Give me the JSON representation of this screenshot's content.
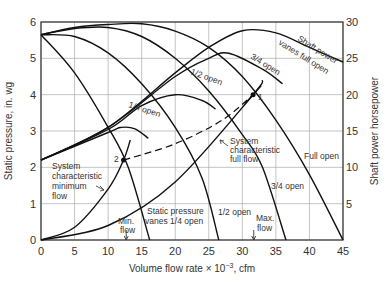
{
  "chart_data": {
    "type": "line",
    "title": "",
    "xlabel": "Volume flow rate × 10⁻³, cfm",
    "ylabel": "Static pressure, in. wg",
    "y2label": "Shaft power horsepower",
    "xlim": [
      0,
      45
    ],
    "ylim": [
      0,
      6
    ],
    "y2lim": [
      0,
      30
    ],
    "xticks": [
      0,
      5,
      10,
      15,
      20,
      25,
      30,
      35,
      40,
      45
    ],
    "yticks": [
      0,
      1,
      2,
      3,
      4,
      5,
      6
    ],
    "y2ticks": [
      5,
      10,
      15,
      20,
      25,
      30
    ],
    "grid": true,
    "series": [
      {
        "name": "Static pressure full open",
        "axis": "left",
        "x": [
          0,
          5,
          10,
          15,
          20,
          25,
          30,
          35,
          40,
          45
        ],
        "y": [
          5.65,
          5.85,
          5.93,
          5.95,
          5.75,
          5.3,
          4.5,
          3.3,
          1.8,
          0
        ]
      },
      {
        "name": "Static pressure 3/4 open",
        "axis": "left",
        "x": [
          0,
          5,
          10,
          15,
          20,
          25,
          30,
          33,
          36.5
        ],
        "y": [
          5.65,
          5.82,
          5.85,
          5.6,
          5.0,
          4.1,
          2.9,
          2.0,
          0
        ]
      },
      {
        "name": "Static pressure 1/2 open",
        "axis": "left",
        "x": [
          0,
          5,
          10,
          15,
          20,
          24,
          26.5
        ],
        "y": [
          5.65,
          5.6,
          5.15,
          4.3,
          3.1,
          1.7,
          0
        ]
      },
      {
        "name": "Static pressure vanes 1/4 open",
        "axis": "left",
        "x": [
          0,
          5,
          10,
          13,
          16.2
        ],
        "y": [
          5.65,
          4.6,
          3.1,
          2.0,
          0
        ]
      },
      {
        "name": "Shaft power vanes full open",
        "axis": "right",
        "x": [
          0,
          10,
          20,
          25,
          30,
          35,
          40,
          45
        ],
        "y": [
          11,
          15.5,
          23,
          26.5,
          28.8,
          28.5,
          26.5,
          24.5
        ]
      },
      {
        "name": "Shaft power 3/4 open",
        "axis": "right",
        "x": [
          0,
          10,
          20,
          25,
          28,
          33,
          36
        ],
        "y": [
          11,
          15.5,
          22.5,
          25,
          25.7,
          23.5,
          21.5
        ]
      },
      {
        "name": "Shaft power 1/2 open",
        "axis": "right",
        "x": [
          0,
          10,
          15,
          20,
          24,
          26
        ],
        "y": [
          11,
          15.2,
          18.5,
          20,
          19.2,
          18
        ]
      },
      {
        "name": "Shaft power 1/4 open",
        "axis": "right",
        "x": [
          0,
          10,
          12,
          14,
          16
        ],
        "y": [
          11,
          14.8,
          15.5,
          15.3,
          14
        ]
      },
      {
        "name": "System characteristic full flow",
        "axis": "left",
        "x": [
          0,
          10,
          20,
          31.6,
          33
        ],
        "y": [
          0,
          0.4,
          1.6,
          4.0,
          4.4
        ]
      },
      {
        "name": "System characteristic minimum flow",
        "axis": "left",
        "x": [
          0,
          5,
          10,
          12.3,
          13.3
        ],
        "y": [
          0,
          0.35,
          1.4,
          2.2,
          2.75
        ]
      },
      {
        "name": "Operating path (dashed)",
        "axis": "left",
        "x": [
          12.3,
          20,
          27,
          31.6
        ],
        "y": [
          2.2,
          2.65,
          3.3,
          4.0
        ],
        "style": "dashed"
      }
    ],
    "points": [
      {
        "label": "1",
        "x": 31.6,
        "y": 4.0
      },
      {
        "label": "2",
        "x": 12.3,
        "y": 2.2
      }
    ],
    "markers": [
      {
        "label": "Min. flow",
        "x": 12.7
      },
      {
        "label": "Max. flow",
        "x": 31.7
      }
    ],
    "annotations": [
      "Shaft power vanes full open",
      "3/4 open",
      "1/2 open",
      "1/4 open",
      "System characteristic full flow",
      "System characteristic minimum flow",
      "Full open",
      "3/4 open",
      "1/2 open",
      "Static pressure vanes 1/4 open",
      "Min. flow",
      "Max. flow"
    ]
  },
  "labels": {
    "xlabel_main": "Volume flow rate × 10",
    "xlabel_exp": "−3",
    "xlabel_unit": ", cfm",
    "ylabel": "Static pressure, in. wg",
    "y2label": "Shaft power horsepower",
    "sp_full_1": "Shaft power",
    "sp_full_2": "vanes full open",
    "sp_34": "3/4 open",
    "sp_12": "1/2 open",
    "sp_14": "1/4 open",
    "sys_full_1": "System",
    "sys_full_2": "characteristic",
    "sys_full_3": "full flow",
    "sys_min_1": "System",
    "sys_min_2": "characteristic",
    "sys_min_3": "minimum",
    "sys_min_4": "flow",
    "st_full": "Full open",
    "st_34": "3/4 open",
    "st_12": "1/2 open",
    "st_14_1": "Static pressure",
    "st_14_2": "vanes 1/4 open",
    "min_1": "Min.",
    "min_2": "flow",
    "max_1": "Max.",
    "max_2": "flow",
    "pt1": "1",
    "pt2": "2"
  }
}
